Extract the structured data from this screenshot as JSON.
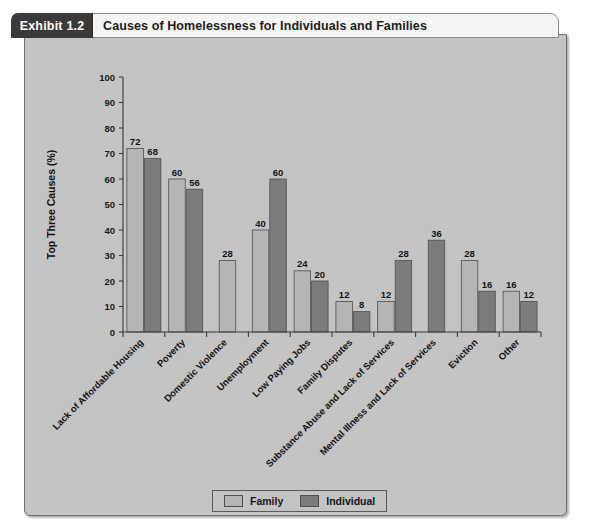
{
  "exhibit": {
    "tab_label": "Exhibit 1.2",
    "title": "Causes of Homelessness for Individuals and Families"
  },
  "colors": {
    "family": "#b5b5b5",
    "individual": "#7b7b7b",
    "panel_bg": "#c3c3c3",
    "tab_bg": "#3a3a3a",
    "axis": "#3a3a3a"
  },
  "legend": {
    "items": [
      {
        "label": "Family",
        "color": "#b5b5b5"
      },
      {
        "label": "Individual",
        "color": "#7b7b7b"
      }
    ]
  },
  "chart_data": {
    "type": "bar",
    "title": "Causes of Homelessness for Individuals and Families",
    "xlabel": "",
    "ylabel": "Top Three Causes (%)",
    "ylim": [
      0,
      100
    ],
    "yticks": [
      0,
      10,
      20,
      30,
      40,
      50,
      60,
      70,
      80,
      90,
      100
    ],
    "grid": false,
    "legend_position": "bottom",
    "categories": [
      "Lack of Affordable Housing",
      "Poverty",
      "Domestic Violence",
      "Unemployment",
      "Low Paying Jobs",
      "Family Disputes",
      "Substance Abuse and Lack of Services",
      "Mental Illness and Lack of Services",
      "Eviction",
      "Other"
    ],
    "series": [
      {
        "name": "Family",
        "color": "#b5b5b5",
        "values": [
          72,
          60,
          28,
          40,
          24,
          12,
          12,
          null,
          28,
          16
        ]
      },
      {
        "name": "Individual",
        "color": "#7b7b7b",
        "values": [
          68,
          56,
          null,
          60,
          20,
          8,
          28,
          36,
          16,
          12
        ]
      }
    ]
  }
}
